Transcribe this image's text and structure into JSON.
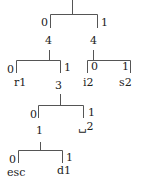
{
  "diagram": {
    "type": "binary-tree",
    "line_color": "#555555",
    "text_color": "#222222",
    "root": {
      "edges": {
        "left": "0",
        "right": "1"
      },
      "children": [
        {
          "label": "4",
          "edges": {
            "left": "0",
            "right": "1"
          },
          "children": [
            {
              "label": "r1"
            },
            {
              "label": "3",
              "edges": {
                "left": "0",
                "right": "1"
              },
              "children": [
                {
                  "label": "1",
                  "edges": {
                    "left": "0",
                    "right": "1"
                  },
                  "children": [
                    {
                      "label": "esc"
                    },
                    {
                      "label": "d1"
                    }
                  ]
                },
                {
                  "label": "␣2"
                }
              ]
            }
          ]
        },
        {
          "label": "4",
          "edges": {
            "left": "0",
            "right": "1"
          },
          "children": [
            {
              "label": "i2"
            },
            {
              "label": "s2"
            }
          ]
        }
      ]
    }
  },
  "nodes": {
    "n_left4": "4",
    "n_right4": "4",
    "n_r1": "r1",
    "n_3": "3",
    "n_i2": "i2",
    "n_s2": "s2",
    "n_1": "1",
    "n_sp2": "␣2",
    "n_esc": "esc",
    "n_d1": "d1"
  },
  "edges": {
    "root_0": "0",
    "root_1": "1",
    "l4_0": "0",
    "l4_1": "1",
    "r4_0": "0",
    "r4_1": "1",
    "n3_0": "0",
    "n3_1": "1",
    "n1_0": "0",
    "n1_1": "1"
  }
}
